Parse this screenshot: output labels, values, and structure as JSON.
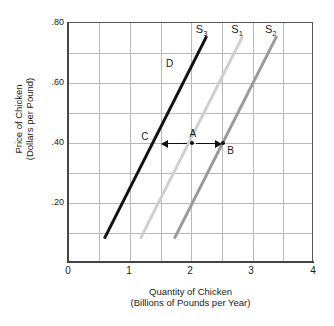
{
  "chart_data": {
    "type": "line",
    "title": "",
    "xlabel": "Quantity of Chicken",
    "xlabel_sub": "(Billions of Pounds per Year)",
    "ylabel": "Price of Chicken",
    "ylabel_sub": "(Dollars per Pound)",
    "xlim": [
      0,
      4
    ],
    "ylim": [
      0,
      0.8
    ],
    "grid": true,
    "legend_position": "inline-curve-labels",
    "xticks": [
      "0",
      "1",
      "2",
      "3",
      "4"
    ],
    "xtick_values": [
      0,
      1,
      2,
      3,
      4
    ],
    "ytick_labels": [
      ".80",
      ".60",
      ".40",
      ".20"
    ],
    "ytick_values": [
      0.8,
      0.6,
      0.4,
      0.2
    ],
    "x_gridline_values": [
      0.5,
      1.0,
      1.5,
      2.0,
      2.5,
      3.0,
      3.5
    ],
    "y_gridline_values": [
      0.1,
      0.2,
      0.3,
      0.4,
      0.5,
      0.6,
      0.7
    ],
    "series": [
      {
        "name": "S3",
        "label": "S",
        "subscript": "3",
        "color": "#111111",
        "width_px": 3,
        "x": [
          0.55,
          2.22
        ],
        "y": [
          0.08,
          0.755
        ],
        "label_x": 2.07,
        "label_y": 0.785
      },
      {
        "name": "S1",
        "label": "S",
        "subscript": "1",
        "color": "#cfcfcf",
        "width_px": 3,
        "x": [
          1.15,
          2.82
        ],
        "y": [
          0.08,
          0.755
        ],
        "label_x": 2.65,
        "label_y": 0.785
      },
      {
        "name": "S2",
        "label": "S",
        "subscript": "2",
        "color": "#9a9a9a",
        "width_px": 3,
        "x": [
          1.7,
          3.37
        ],
        "y": [
          0.08,
          0.755
        ],
        "label_x": 3.2,
        "label_y": 0.785
      }
    ],
    "points": [
      {
        "name": "A",
        "label": "A",
        "x": 2.0,
        "y": 0.4,
        "dot": true,
        "label_dx": -2,
        "label_dy": -14
      },
      {
        "name": "B",
        "label": "B",
        "x": 2.52,
        "y": 0.4,
        "dot": true,
        "label_dx": 4,
        "label_dy": 3
      },
      {
        "name": "C",
        "label": "C",
        "x": 1.41,
        "y": 0.4,
        "dot": false,
        "label_dx": -14,
        "label_dy": -11
      },
      {
        "name": "D",
        "label": "D",
        "x": 1.83,
        "y": 0.655,
        "dot": false,
        "label_dx": -15,
        "label_dy": -8
      }
    ],
    "annotations": [
      {
        "name": "shift-left-arrow",
        "direction": "left",
        "from_x": 1.92,
        "to_x": 1.52,
        "y": 0.4
      },
      {
        "name": "shift-right-arrow",
        "direction": "right",
        "from_x": 2.08,
        "to_x": 2.48,
        "y": 0.4
      }
    ]
  }
}
